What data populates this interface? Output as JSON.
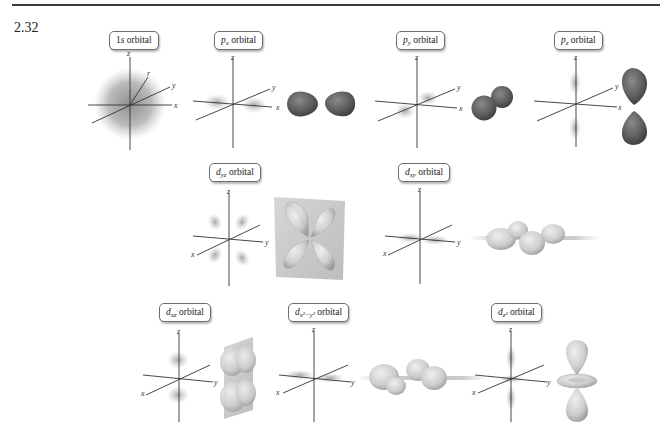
{
  "problem_number": "2.32",
  "colors": {
    "rule": "#3a3a3a",
    "axis": "#333333",
    "p_lobe": "#5f5f5f",
    "d_lobe": "#cfcfcf",
    "plane": "#c8c8c8",
    "cloud": "#8a8a8a"
  },
  "axis_labels": {
    "x": "x",
    "y": "y",
    "z": "z",
    "r": "r"
  },
  "orbitals": [
    {
      "id": "1s",
      "base": "1",
      "sub": "s",
      "sup": "",
      "suffix": " orbital",
      "style": "1s"
    },
    {
      "id": "px",
      "base": "p",
      "sub": "x",
      "sup": "",
      "suffix": " orbital"
    },
    {
      "id": "py",
      "base": "p",
      "sub": "y",
      "sup": "",
      "suffix": " orbital"
    },
    {
      "id": "pz",
      "base": "p",
      "sub": "z",
      "sup": "",
      "suffix": " orbital"
    },
    {
      "id": "dyz",
      "base": "d",
      "sub": "yz",
      "sup": "",
      "suffix": " orbital"
    },
    {
      "id": "dxy",
      "base": "d",
      "sub": "xy",
      "sup": "",
      "suffix": " orbital"
    },
    {
      "id": "dxz",
      "base": "d",
      "sub": "xz",
      "sup": "",
      "suffix": " orbital"
    },
    {
      "id": "dx2y2",
      "base": "d",
      "sub": "x²−y²",
      "sup": "",
      "suffix": " orbital"
    },
    {
      "id": "dz2",
      "base": "d",
      "sub": "z²",
      "sup": "",
      "suffix": " orbital"
    }
  ],
  "labels": {
    "s1": {
      "num": "1",
      "letter": "s",
      "suffix": " orbital"
    },
    "px": {
      "letter": "p",
      "sub": "x",
      "suffix": " orbital"
    },
    "py": {
      "letter": "p",
      "sub": "y",
      "suffix": " orbital"
    },
    "pz": {
      "letter": "p",
      "sub": "z",
      "suffix": " orbital"
    },
    "dyz": {
      "letter": "d",
      "sub": "yz",
      "suffix": " orbital"
    },
    "dxy": {
      "letter": "d",
      "sub": "xy",
      "suffix": " orbital"
    },
    "dxz": {
      "letter": "d",
      "sub": "xz",
      "suffix": " orbital"
    },
    "dx2y2": {
      "letter": "d",
      "sub": "x²−y²",
      "suffix": " orbital"
    },
    "dz2": {
      "letter": "d",
      "sub": "z²",
      "suffix": " orbital"
    }
  }
}
